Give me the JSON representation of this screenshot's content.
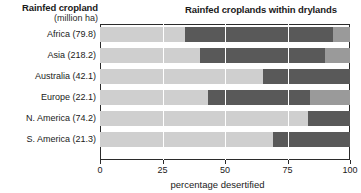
{
  "titles": {
    "left_main": "Rainfed cropland",
    "left_sub": "(million ha)",
    "right": "Rainfed croplands within drylands"
  },
  "axis": {
    "x_title": "percentage desertified",
    "ticks": [
      "0",
      "25",
      "50",
      "75",
      "100"
    ],
    "tick_values": [
      0,
      25,
      50,
      75,
      100
    ],
    "xlim": [
      0,
      100
    ]
  },
  "colors": {
    "light": "#cfcfcf",
    "medium": "#9a9a9a",
    "dark": "#595959",
    "frame": "#2b2b2b",
    "background": "#ffffff"
  },
  "rows": [
    {
      "label": "Africa (79.8)",
      "region": "Africa",
      "area_million_ha": 79.8,
      "light": 34,
      "dark": 59,
      "medium": 7
    },
    {
      "label": "Asia (218.2)",
      "region": "Asia",
      "area_million_ha": 218.2,
      "light": 40,
      "dark": 50,
      "medium": 10
    },
    {
      "label": "Australia (42.1)",
      "region": "Australia",
      "area_million_ha": 42.1,
      "light": 65,
      "dark": 35,
      "medium": 0
    },
    {
      "label": "Europe (22.1)",
      "region": "Europe",
      "area_million_ha": 22.1,
      "light": 43,
      "dark": 41,
      "medium": 16
    },
    {
      "label": "N. America (74.2)",
      "region": "N. America",
      "area_million_ha": 74.2,
      "light": 83,
      "dark": 17,
      "medium": 0
    },
    {
      "label": "S. America (21.3)",
      "region": "S. America",
      "area_million_ha": 21.3,
      "light": 69,
      "dark": 31,
      "medium": 0
    }
  ],
  "chart_data": {
    "type": "bar",
    "orientation": "horizontal",
    "stacked": true,
    "title": "Rainfed croplands within drylands",
    "ylabel": "Rainfed cropland (million ha)",
    "xlabel": "percentage desertified",
    "xlim": [
      0,
      100
    ],
    "xticks": [
      0,
      25,
      50,
      75,
      100
    ],
    "grid": true,
    "legend": "none",
    "categories": [
      "Africa (79.8)",
      "Asia (218.2)",
      "Australia (42.1)",
      "Europe (22.1)",
      "N. America (74.2)",
      "S. America (21.3)"
    ],
    "series": [
      {
        "name": "light-segment",
        "color": "#cfcfcf",
        "values": [
          34,
          40,
          65,
          43,
          83,
          69
        ]
      },
      {
        "name": "dark-segment",
        "color": "#595959",
        "values": [
          59,
          50,
          35,
          41,
          17,
          31
        ]
      },
      {
        "name": "medium-segment",
        "color": "#9a9a9a",
        "values": [
          7,
          10,
          0,
          16,
          0,
          0
        ]
      }
    ]
  }
}
